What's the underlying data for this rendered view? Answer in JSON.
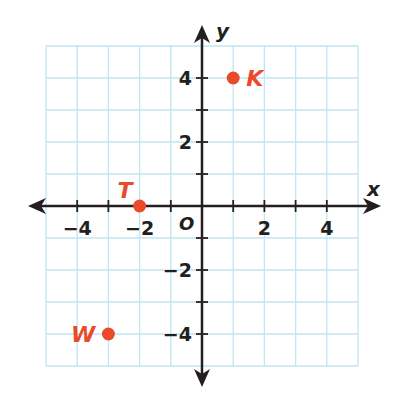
{
  "chart_data": {
    "type": "scatter",
    "title": "",
    "xlabel": "x",
    "ylabel": "y",
    "origin_label": "O",
    "xlim": [
      -5,
      5
    ],
    "ylim": [
      -5,
      5
    ],
    "grid": true,
    "x_ticks": [
      -4,
      -2,
      2,
      4
    ],
    "y_ticks": [
      4,
      2,
      -2,
      -4
    ],
    "x_tick_labels": [
      "−4",
      "−2",
      "2",
      "4"
    ],
    "y_tick_labels": [
      "4",
      "2",
      "−2",
      "−4"
    ],
    "points": [
      {
        "label": "K",
        "x": 1,
        "y": 4
      },
      {
        "label": "T",
        "x": -2,
        "y": 0
      },
      {
        "label": "W",
        "x": -3,
        "y": -4
      }
    ],
    "colors": {
      "grid": "#bfe6f1",
      "axis": "#231f20",
      "point": "#ea4a2a"
    }
  }
}
